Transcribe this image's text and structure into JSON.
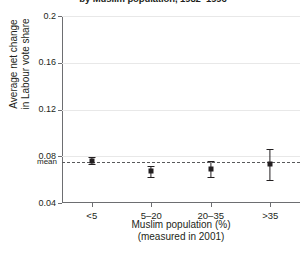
{
  "chart_data": {
    "type": "scatter",
    "title": "by Muslim population, 1982–1996",
    "xlabel_line1": "Muslim population (%)",
    "xlabel_line2": "(measured in 2001)",
    "ylabel_line1": "Average net change",
    "ylabel_line2": "in Labour vote share",
    "categories": [
      "<5",
      "5–20",
      "20–35",
      ">35"
    ],
    "values": [
      0.076,
      0.067,
      0.069,
      0.073
    ],
    "error_low": [
      0.0735,
      0.0625,
      0.062,
      0.06
    ],
    "error_high": [
      0.0795,
      0.072,
      0.076,
      0.086
    ],
    "yticks": [
      "0.2",
      "0.16",
      "0.12",
      "0.08",
      "0.04"
    ],
    "ytick_values": [
      0.2,
      0.16,
      0.12,
      0.08,
      0.04
    ],
    "ylim": [
      0.04,
      0.2
    ],
    "mean_value": 0.0753,
    "mean_label": "mean",
    "grid": true,
    "legend": "none",
    "marker_color": "#231f20",
    "mean_line_color": "#58595b",
    "grid_color": "#e8e8e8",
    "axis_color": "#6d6e71"
  }
}
